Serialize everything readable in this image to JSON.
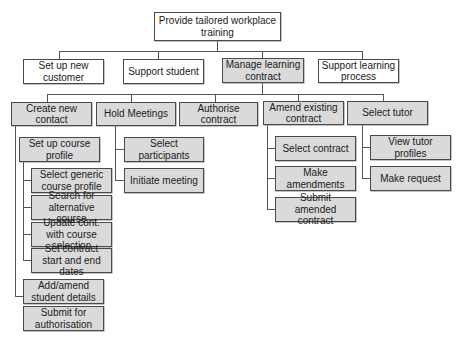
{
  "diagram": {
    "type": "hierarchy",
    "colors": {
      "highlight_fill": "#dadada",
      "plain_fill": "#ffffff",
      "border": "#4a4a4a"
    },
    "root": {
      "label": "Provide tailored workplace training"
    },
    "level1": [
      {
        "label": "Set up new customer"
      },
      {
        "label": "Support student"
      },
      {
        "label": "Manage learning contract"
      },
      {
        "label": "Support learning process"
      }
    ],
    "level2": [
      {
        "label": "Create new contact"
      },
      {
        "label": "Hold Meetings"
      },
      {
        "label": "Authorise contract"
      },
      {
        "label": "Amend existing contract"
      },
      {
        "label": "Select tutor"
      }
    ],
    "create_contact_children": [
      {
        "label": "Set up course profile"
      },
      {
        "label": "Add/amend student details"
      },
      {
        "label": "Submit for authorisation"
      }
    ],
    "course_profile_children": [
      {
        "label": "Select generic course profile"
      },
      {
        "label": "Search for alternative course"
      },
      {
        "label": "Update cont. with course selection"
      },
      {
        "label": "Set contract start and end dates"
      }
    ],
    "meetings_children": [
      {
        "label": "Select participants"
      },
      {
        "label": "Initiate meeting"
      }
    ],
    "amend_children": [
      {
        "label": "Select contract"
      },
      {
        "label": "Make amendments"
      },
      {
        "label": "Submit amended contract"
      }
    ],
    "tutor_children": [
      {
        "label": "View tutor profiles"
      },
      {
        "label": "Make request"
      }
    ]
  }
}
